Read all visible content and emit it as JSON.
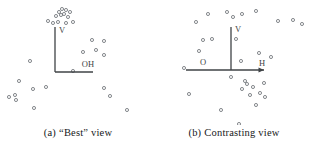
{
  "figure": {
    "background_color": "#ffffff",
    "ink_color": "#3f4346",
    "point_color": "#6f7478",
    "caption_color": "#16181a",
    "width": 312,
    "height": 155
  },
  "panels": [
    {
      "id": "panel-a",
      "caption_tag": "(a)",
      "caption_text": "“Best” view",
      "caption_full": "(a) “Best” view",
      "axes": {
        "origin": {
          "x": 55,
          "y": 72
        },
        "vertical": {
          "x1": 55,
          "y1": 72,
          "x2": 55,
          "y2": 27,
          "label": "V",
          "label_x": 59,
          "label_y": 33
        },
        "horizontal": {
          "x1": 55,
          "y1": 72,
          "x2": 93,
          "y2": 72,
          "label": "OH",
          "label_x": 88,
          "label_y": 67
        },
        "vertical_arrow": false,
        "horizontal_arrow": false
      },
      "points": [
        {
          "x": 59,
          "y": 12
        },
        {
          "x": 62,
          "y": 9
        },
        {
          "x": 66,
          "y": 10
        },
        {
          "x": 56,
          "y": 16
        },
        {
          "x": 61,
          "y": 15
        },
        {
          "x": 64,
          "y": 14
        },
        {
          "x": 70,
          "y": 12
        },
        {
          "x": 68,
          "y": 17
        },
        {
          "x": 48,
          "y": 21
        },
        {
          "x": 53,
          "y": 23
        },
        {
          "x": 58,
          "y": 22
        },
        {
          "x": 66,
          "y": 23
        },
        {
          "x": 73,
          "y": 22
        },
        {
          "x": 92,
          "y": 40
        },
        {
          "x": 104,
          "y": 41
        },
        {
          "x": 83,
          "y": 52
        },
        {
          "x": 96,
          "y": 50
        },
        {
          "x": 104,
          "y": 55
        },
        {
          "x": 30,
          "y": 61
        },
        {
          "x": 73,
          "y": 71
        },
        {
          "x": 19,
          "y": 81
        },
        {
          "x": 33,
          "y": 89
        },
        {
          "x": 46,
          "y": 87
        },
        {
          "x": 104,
          "y": 88
        },
        {
          "x": 9,
          "y": 97
        },
        {
          "x": 15,
          "y": 95
        },
        {
          "x": 16,
          "y": 100
        },
        {
          "x": 110,
          "y": 96
        },
        {
          "x": 34,
          "y": 108
        },
        {
          "x": 127,
          "y": 110
        },
        {
          "x": 113,
          "y": 127
        }
      ]
    },
    {
      "id": "panel-b",
      "caption_tag": "(b)",
      "caption_text": "Contrasting view",
      "caption_full": "(b) Contrasting view",
      "axes": {
        "origin": {
          "x": 75,
          "y": 70
        },
        "vertical": {
          "x1": 75,
          "y1": 70,
          "x2": 75,
          "y2": 27,
          "label": "V",
          "label_x": 79,
          "label_y": 32
        },
        "horizontal": {
          "x1": 30,
          "y1": 70,
          "x2": 108,
          "y2": 70,
          "label_left": "O",
          "label_left_x": 47,
          "label_left_y": 65,
          "label_right": "H",
          "label_right_x": 106,
          "label_right_y": 66
        },
        "vertical_arrow": false,
        "horizontal_arrow": true
      },
      "points": [
        {
          "x": 52,
          "y": 14
        },
        {
          "x": 71,
          "y": 12
        },
        {
          "x": 86,
          "y": 14
        },
        {
          "x": 100,
          "y": 11
        },
        {
          "x": 40,
          "y": 22
        },
        {
          "x": 77,
          "y": 17
        },
        {
          "x": 122,
          "y": 21
        },
        {
          "x": 137,
          "y": 20
        },
        {
          "x": 146,
          "y": 24
        },
        {
          "x": 47,
          "y": 40
        },
        {
          "x": 56,
          "y": 39
        },
        {
          "x": 80,
          "y": 39
        },
        {
          "x": 43,
          "y": 51
        },
        {
          "x": 103,
          "y": 53
        },
        {
          "x": 115,
          "y": 57
        },
        {
          "x": 85,
          "y": 61
        },
        {
          "x": 28,
          "y": 68
        },
        {
          "x": 75,
          "y": 77
        },
        {
          "x": 89,
          "y": 81
        },
        {
          "x": 91,
          "y": 84
        },
        {
          "x": 86,
          "y": 89
        },
        {
          "x": 97,
          "y": 87
        },
        {
          "x": 108,
          "y": 83
        },
        {
          "x": 33,
          "y": 94
        },
        {
          "x": 94,
          "y": 95
        },
        {
          "x": 104,
          "y": 93
        },
        {
          "x": 109,
          "y": 97
        },
        {
          "x": 100,
          "y": 105
        },
        {
          "x": 65,
          "y": 110
        },
        {
          "x": 83,
          "y": 124
        }
      ]
    }
  ]
}
